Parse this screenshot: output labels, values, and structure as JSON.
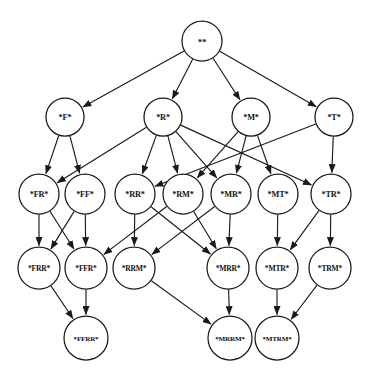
{
  "diagram": {
    "type": "directed-acyclic-graph",
    "background_color": "#ffffff",
    "node_fill": "#ffffff",
    "node_stroke": "#1a1a1a",
    "edge_color": "#1a1a1a",
    "node_radius": 19,
    "nodes": [
      {
        "id": "root",
        "label": "**",
        "x": 202,
        "y": 41,
        "r": 20
      },
      {
        "id": "F",
        "label": "*F*",
        "x": 65,
        "y": 117,
        "r": 19
      },
      {
        "id": "R",
        "label": "*R*",
        "x": 163,
        "y": 117,
        "r": 19
      },
      {
        "id": "M",
        "label": "*M*",
        "x": 251,
        "y": 117,
        "r": 19
      },
      {
        "id": "T",
        "label": "*T*",
        "x": 334,
        "y": 117,
        "r": 19
      },
      {
        "id": "FR",
        "label": "*FR*",
        "x": 39,
        "y": 194,
        "r": 20
      },
      {
        "id": "FF",
        "label": "*FF*",
        "x": 85,
        "y": 194,
        "r": 20
      },
      {
        "id": "RR",
        "label": "*RR*",
        "x": 135,
        "y": 194,
        "r": 20
      },
      {
        "id": "RM",
        "label": "*RM*",
        "x": 183,
        "y": 194,
        "r": 20
      },
      {
        "id": "MR",
        "label": "*MR*",
        "x": 231,
        "y": 194,
        "r": 20
      },
      {
        "id": "MT",
        "label": "*MT*",
        "x": 278,
        "y": 194,
        "r": 20
      },
      {
        "id": "TR",
        "label": "*TR*",
        "x": 331,
        "y": 194,
        "r": 20
      },
      {
        "id": "FRR",
        "label": "*FRR*",
        "x": 39,
        "y": 268,
        "r": 21
      },
      {
        "id": "FFR",
        "label": "*FFR*",
        "x": 86,
        "y": 268,
        "r": 21
      },
      {
        "id": "RRM",
        "label": "*RRM*",
        "x": 134,
        "y": 268,
        "r": 21
      },
      {
        "id": "MRR",
        "label": "*MRR*",
        "x": 228,
        "y": 268,
        "r": 21
      },
      {
        "id": "MTR",
        "label": "*MTR*",
        "x": 277,
        "y": 268,
        "r": 21
      },
      {
        "id": "TRM",
        "label": "*TRM*",
        "x": 330,
        "y": 268,
        "r": 21
      },
      {
        "id": "FFRR",
        "label": "*FFRR*",
        "x": 86,
        "y": 338,
        "r": 22
      },
      {
        "id": "MRRM",
        "label": "*MRRM*",
        "x": 230,
        "y": 338,
        "r": 22
      },
      {
        "id": "MTRM",
        "label": "*MTRM*",
        "x": 277,
        "y": 338,
        "r": 22
      }
    ],
    "edges": [
      {
        "from": "root",
        "to": "F"
      },
      {
        "from": "root",
        "to": "R"
      },
      {
        "from": "root",
        "to": "M"
      },
      {
        "from": "root",
        "to": "T"
      },
      {
        "from": "F",
        "to": "FR"
      },
      {
        "from": "F",
        "to": "FF"
      },
      {
        "from": "R",
        "to": "FR"
      },
      {
        "from": "R",
        "to": "RR"
      },
      {
        "from": "R",
        "to": "RM"
      },
      {
        "from": "R",
        "to": "MR"
      },
      {
        "from": "R",
        "to": "TR"
      },
      {
        "from": "M",
        "to": "RM"
      },
      {
        "from": "M",
        "to": "MR"
      },
      {
        "from": "M",
        "to": "MT"
      },
      {
        "from": "T",
        "to": "TR"
      },
      {
        "from": "T",
        "to": "RR"
      },
      {
        "from": "FR",
        "to": "FRR"
      },
      {
        "from": "FR",
        "to": "FFR"
      },
      {
        "from": "FF",
        "to": "FRR"
      },
      {
        "from": "FF",
        "to": "FFR"
      },
      {
        "from": "RR",
        "to": "RRM"
      },
      {
        "from": "RR",
        "to": "MRR"
      },
      {
        "from": "RM",
        "to": "FFR"
      },
      {
        "from": "RM",
        "to": "MRR"
      },
      {
        "from": "MR",
        "to": "MRR"
      },
      {
        "from": "MR",
        "to": "RRM"
      },
      {
        "from": "MT",
        "to": "MTR"
      },
      {
        "from": "TR",
        "to": "MTR"
      },
      {
        "from": "TR",
        "to": "TRM"
      },
      {
        "from": "FRR",
        "to": "FFRR"
      },
      {
        "from": "FFR",
        "to": "FFRR"
      },
      {
        "from": "RRM",
        "to": "MRRM"
      },
      {
        "from": "MRR",
        "to": "MRRM"
      },
      {
        "from": "MTR",
        "to": "MTRM"
      },
      {
        "from": "TRM",
        "to": "MTRM"
      }
    ]
  }
}
